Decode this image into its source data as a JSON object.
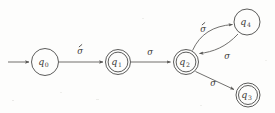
{
  "figure": {
    "background_color": "#fdfdfc",
    "stroke_color": "#575654",
    "text_color": "#3d3c3a",
    "width": 275,
    "height": 113
  },
  "states": [
    {
      "id": "q0",
      "base": "q",
      "subscript": "0",
      "accepting": false,
      "start": true,
      "cx": 45,
      "cy": 62,
      "r": 13.5
    },
    {
      "id": "q1",
      "base": "q",
      "subscript": "1",
      "accepting": true,
      "start": false,
      "cx": 118,
      "cy": 62,
      "r": 12.5
    },
    {
      "id": "q2",
      "base": "q",
      "subscript": "2",
      "accepting": true,
      "start": false,
      "cx": 186,
      "cy": 62,
      "r": 12.5
    },
    {
      "id": "q3",
      "base": "q",
      "subscript": "3",
      "accepting": true,
      "start": false,
      "cx": 248,
      "cy": 95,
      "r": 12
    },
    {
      "id": "q4",
      "base": "q",
      "subscript": "4",
      "accepting": false,
      "start": false,
      "cx": 247,
      "cy": 22,
      "r": 13
    }
  ],
  "transitions": [
    {
      "id": "start-q0",
      "from": "start",
      "to": "q0",
      "label": "",
      "accent": false,
      "shape": "straight"
    },
    {
      "id": "q0-q1",
      "from": "q0",
      "to": "q1",
      "label": "σ",
      "accent": true,
      "shape": "straight",
      "label_x": 80,
      "label_y": 50
    },
    {
      "id": "q1-q2",
      "from": "q1",
      "to": "q2",
      "label": "σ",
      "accent": false,
      "shape": "straight",
      "label_x": 150,
      "label_y": 52
    },
    {
      "id": "q2-q4",
      "from": "q2",
      "to": "q4",
      "label": "σ",
      "accent": true,
      "shape": "curve-up",
      "label_x": 203,
      "label_y": 28
    },
    {
      "id": "q4-q2",
      "from": "q4",
      "to": "q2",
      "label": "σ",
      "accent": false,
      "shape": "curve-down",
      "label_x": 227,
      "label_y": 56
    },
    {
      "id": "q2-q3",
      "from": "q2",
      "to": "q3",
      "label": "σ",
      "accent": false,
      "shape": "straight",
      "label_x": 213,
      "label_y": 83
    }
  ]
}
